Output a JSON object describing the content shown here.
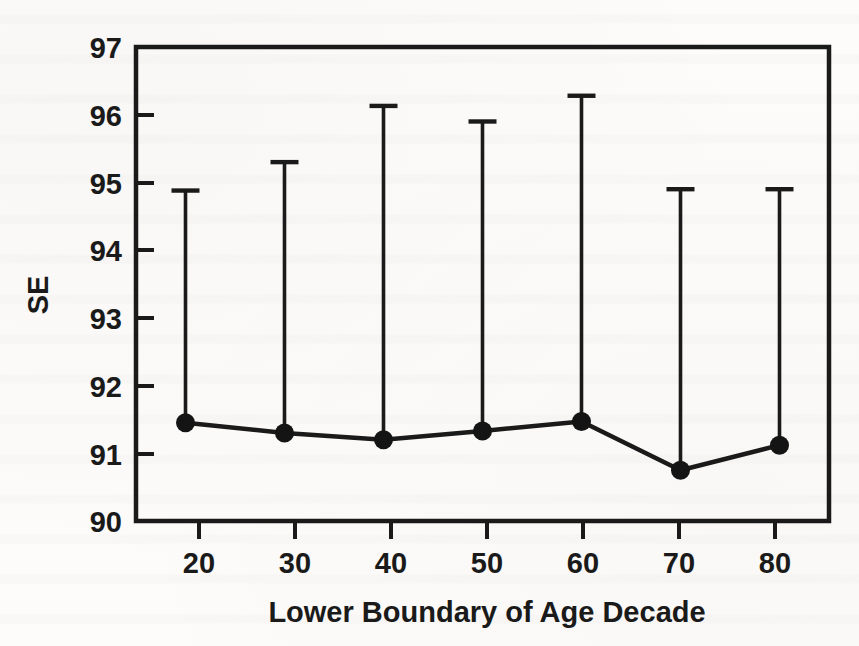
{
  "figure": {
    "background_color": "#fdfcfa",
    "ink_color": "#1a1a1a",
    "media": "scanned-journal-page"
  },
  "chart_data": {
    "type": "line",
    "title": "",
    "subtitle": "",
    "xlabel": "Lower Boundary of Age Decade",
    "ylabel": "SE",
    "categories": [
      20,
      30,
      40,
      50,
      60,
      70,
      80
    ],
    "x": [
      20,
      30,
      40,
      50,
      60,
      70,
      80
    ],
    "xtick_labels": [
      "20",
      "30",
      "40",
      "50",
      "60",
      "70",
      "80"
    ],
    "ytick_labels": [
      "90",
      "91",
      "92",
      "93",
      "94",
      "95",
      "96",
      "97"
    ],
    "yticks": [
      90,
      91,
      92,
      93,
      94,
      95,
      96,
      97
    ],
    "xlim": [
      15,
      85
    ],
    "ylim": [
      90,
      97
    ],
    "grid": false,
    "legend": false,
    "legend_position": "none",
    "marker": "filled-circle",
    "error_bar_style": "upper-only-with-cap",
    "series": [
      {
        "name": "SE",
        "values": [
          91.45,
          91.3,
          91.2,
          91.33,
          91.47,
          90.75,
          91.12
        ],
        "error_upper": [
          94.88,
          95.3,
          96.13,
          95.9,
          96.28,
          94.9,
          94.9
        ]
      }
    ],
    "annotations": []
  },
  "axes": {
    "y_axis_label": "SE",
    "x_axis_label": "Lower Boundary of Age Decade"
  }
}
